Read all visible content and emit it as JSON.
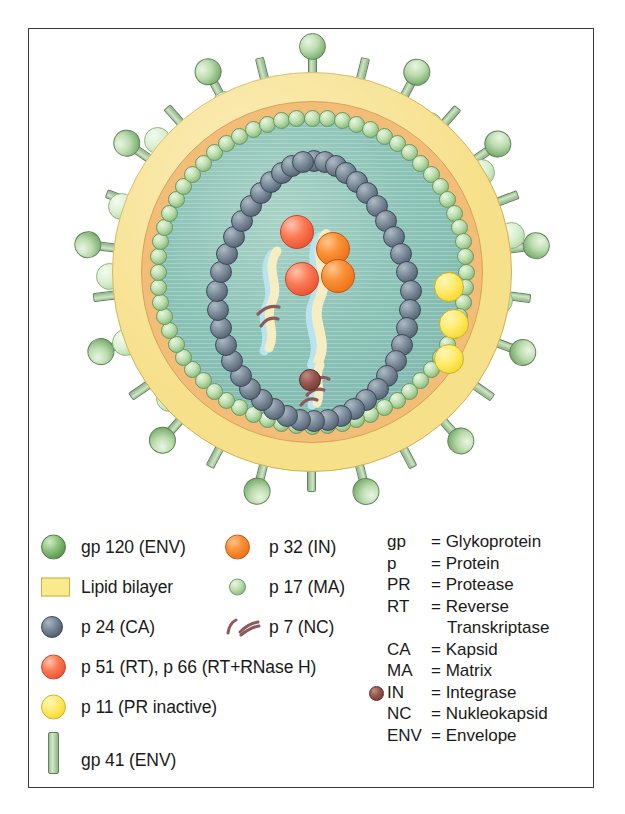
{
  "figure": {
    "caption": ""
  },
  "colors": {
    "lipid_bilayer": "#f7e08a",
    "matrix_ring": "#f2bd76",
    "interior": "#8cc3b7",
    "gp120": "#8fc47f",
    "gp41": "#9cc196",
    "p24": "#5a6877",
    "p17": "#8cbd7e",
    "rt": "#ef5634",
    "in_p32": "#f0741a",
    "pr_p11": "#f7da34",
    "integrase_dot": "#7b3e38",
    "nc_p7": "#8c5a5c",
    "frame_border": "#3a3a3a"
  },
  "diagram": {
    "layers": [
      {
        "name": "lipid-bilayer",
        "label": "Lipid bilayer"
      },
      {
        "name": "matrix-layer",
        "label": "p 17 (MA)"
      },
      {
        "name": "capsid-core",
        "label": "p 24 (CA)"
      },
      {
        "name": "viral-rna",
        "label": "RNA strands"
      }
    ],
    "counts": {
      "gp120_spikes": 22,
      "gp41_stalks": 26,
      "p17_beads": 64,
      "p24_beads": 44,
      "rt_spheres": 2,
      "in_spheres": 2,
      "pr_spheres": 3,
      "integrase_spheres": 1,
      "rna_strands": 2
    }
  },
  "legend": {
    "column1": [
      {
        "swatch": "ball-green",
        "label": "gp 120 (ENV)"
      },
      {
        "swatch": "rect-yellow",
        "label": "Lipid bilayer"
      },
      {
        "swatch": "ball-slate",
        "label": "p 24 (CA)"
      },
      {
        "swatch": "ball-red",
        "label": "p 51 (RT), p 66 (RT+RNase H)"
      },
      {
        "swatch": "ball-yellow",
        "label": "p 11 (PR inactive)"
      },
      {
        "swatch": "bar-green",
        "label": "gp 41 (ENV)"
      }
    ],
    "column2": [
      {
        "swatch": "ball-orange",
        "label": "p 32 (IN)"
      },
      {
        "swatch": "ball-green-sm",
        "label": "p 17 (MA)"
      },
      {
        "swatch": "nc-glyph",
        "label": "p 7 (NC)"
      }
    ],
    "abbreviations": [
      {
        "key": "gp",
        "value": "= Glykoprotein",
        "dot": false,
        "continuation": false
      },
      {
        "key": "p",
        "value": "= Protein",
        "dot": false,
        "continuation": false
      },
      {
        "key": "PR",
        "value": "= Protease",
        "dot": false,
        "continuation": false
      },
      {
        "key": "RT",
        "value": "= Reverse",
        "dot": false,
        "continuation": false
      },
      {
        "key": "",
        "value": "Transkriptase",
        "dot": false,
        "continuation": true
      },
      {
        "key": "CA",
        "value": "= Kapsid",
        "dot": false,
        "continuation": false
      },
      {
        "key": "MA",
        "value": "= Matrix",
        "dot": false,
        "continuation": false
      },
      {
        "key": "IN",
        "value": "= Integrase",
        "dot": true,
        "continuation": false
      },
      {
        "key": "NC",
        "value": "= Nukleokapsid",
        "dot": false,
        "continuation": false
      },
      {
        "key": "ENV",
        "value": "= Envelope",
        "dot": false,
        "continuation": false
      }
    ]
  }
}
